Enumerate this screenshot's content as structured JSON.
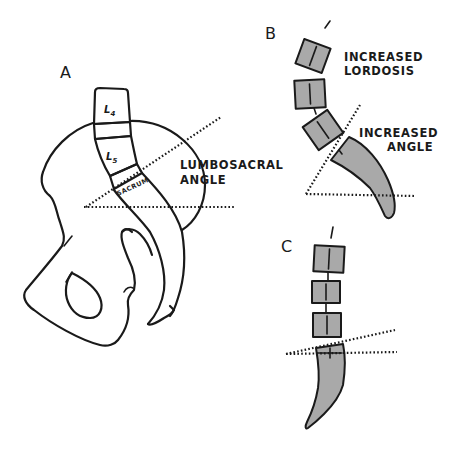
{
  "figure": {
    "panels": [
      {
        "id": "A",
        "letter": "A",
        "vertebra_labels": [
          "L4",
          "L5"
        ],
        "vertebra_label_parts": {
          "l4_main": "L",
          "l4_sub": "4",
          "l5_main": "L",
          "l5_sub": "5"
        },
        "sacrum_label": "SACRUM",
        "angle_label": [
          "LUMBOSACRAL",
          "ANGLE"
        ]
      },
      {
        "id": "B",
        "letter": "B",
        "labels": {
          "lordosis": [
            "INCREASED",
            "LORDOSIS"
          ],
          "angle": [
            "INCREASED",
            "ANGLE"
          ]
        }
      },
      {
        "id": "C",
        "letter": "C"
      }
    ],
    "colors": {
      "ink": "#1a1a1a",
      "shading": "#a9a9a9",
      "background": "#ffffff"
    }
  }
}
